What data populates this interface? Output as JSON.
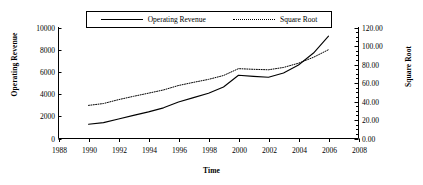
{
  "chart_data": {
    "type": "line",
    "title": "",
    "xlabel": "Time",
    "ylabel": "Operating Revenue",
    "y2label": "Square Root",
    "x": [
      1990,
      1991,
      1992,
      1993,
      1994,
      1995,
      1996,
      1997,
      1998,
      1999,
      2000,
      2001,
      2002,
      2003,
      2004,
      2005,
      2006
    ],
    "xlim": [
      1988,
      2008
    ],
    "xticks": [
      1988,
      1990,
      1992,
      1994,
      1996,
      1998,
      2000,
      2002,
      2004,
      2006,
      2008
    ],
    "xticklabels": [
      "1988",
      "1990",
      "1992",
      "1994",
      "1996",
      "1998",
      "2000",
      "2002",
      "2004",
      "2006",
      "2008"
    ],
    "ylim": [
      0,
      10000
    ],
    "yticks": [
      0,
      2000,
      4000,
      6000,
      8000,
      10000
    ],
    "yticklabels": [
      "0",
      "2000",
      "4000",
      "6000",
      "8000",
      "10000"
    ],
    "y2lim": [
      0,
      120
    ],
    "y2ticks": [
      0,
      20,
      40,
      60,
      80,
      100,
      120
    ],
    "y2ticklabels": [
      "0.00",
      "20.00",
      "40.00",
      "60.00",
      "80.00",
      "100.00",
      "120.00"
    ],
    "y2minor_step": 5,
    "grid": false,
    "legend_position": "top-center",
    "series": [
      {
        "name": "Operating Revenue",
        "axis": "left",
        "style": "solid",
        "color": "#000000",
        "values": [
          1280,
          1430,
          1760,
          2080,
          2400,
          2760,
          3280,
          3680,
          4080,
          4640,
          5700,
          5600,
          5520,
          5900,
          6620,
          7700,
          9220
        ]
      },
      {
        "name": "Square Root",
        "axis": "right",
        "style": "dotted",
        "color": "#000000",
        "values": [
          35.8,
          37.8,
          42.0,
          45.6,
          49.0,
          52.5,
          57.3,
          60.7,
          63.9,
          68.1,
          75.5,
          74.8,
          74.3,
          76.8,
          81.4,
          87.8,
          96.0
        ]
      }
    ]
  },
  "legend": {
    "items": [
      {
        "label": "Operating Revenue",
        "style": "solid"
      },
      {
        "label": "Square Root",
        "style": "dotted"
      }
    ]
  },
  "axes": {
    "left_title": "Operating Revenue",
    "right_title": "Square Root",
    "bottom_title": "Time"
  },
  "colors": {
    "line": "#000000",
    "axis": "#000000",
    "background": "#ffffff"
  }
}
